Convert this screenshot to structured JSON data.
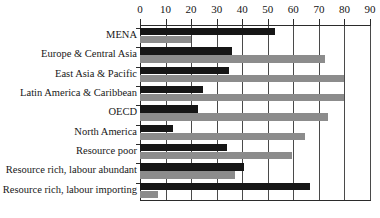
{
  "chart_data": {
    "type": "bar",
    "orientation": "horizontal",
    "title": "",
    "subtitle": "",
    "xlabel": "",
    "ylabel": "",
    "xlim": [
      0,
      90
    ],
    "xticks": [
      0,
      10,
      20,
      30,
      40,
      50,
      60,
      70,
      80,
      90
    ],
    "xtick_labels": [
      "0",
      "10",
      "20",
      "30",
      "40",
      "50",
      "60",
      "70",
      "80",
      "90"
    ],
    "grid": true,
    "grid_axis": "x",
    "legend": false,
    "legend_position": "none",
    "categories": [
      "MENA",
      "Europe & Central Asia",
      "East Asia & Pacific",
      "Latin America & Caribbean",
      "OECD",
      "North America",
      "Resource poor",
      "Resource rich, labour abundant",
      "Resource rich, labour importing"
    ],
    "series": [
      {
        "name": "series-dark",
        "color": "#161616",
        "values": [
          53,
          36,
          35,
          24.5,
          22.5,
          13,
          34,
          40.5,
          66.5
        ]
      },
      {
        "name": "series-grey",
        "color": "#8c8c8c",
        "values": [
          20,
          72.5,
          80,
          80,
          73.5,
          64.5,
          59.5,
          37,
          7
        ]
      }
    ]
  },
  "colors": {
    "dark_bar": "#161616",
    "grey_bar": "#8c8c8c",
    "axis": "#2b2b2b",
    "gridline": "#4a4a4a",
    "background": "#ffffff",
    "text": "#171717"
  }
}
